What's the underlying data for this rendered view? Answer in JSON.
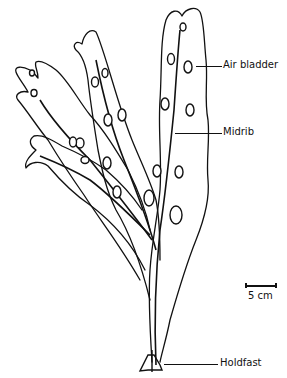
{
  "figure": {
    "labels": [
      {
        "id": "air-bladder",
        "text": "Air bladder"
      },
      {
        "id": "midrib",
        "text": "Midrib"
      },
      {
        "id": "holdfast",
        "text": "Holdfast"
      }
    ],
    "scale_bar": {
      "text": "5 cm"
    },
    "colors": {
      "ink": "#111111",
      "background": "#ffffff"
    }
  }
}
